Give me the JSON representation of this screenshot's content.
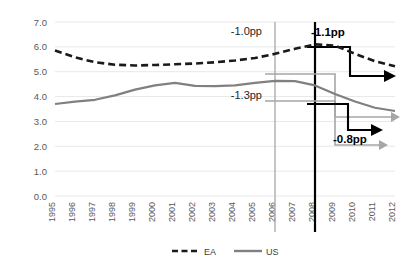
{
  "chart_data": {
    "type": "line",
    "title": "",
    "xlabel": "",
    "ylabel": "",
    "ylim": [
      0.0,
      7.0
    ],
    "ytick_labels": [
      "0.0",
      "1.0",
      "2.0",
      "3.0",
      "4.0",
      "5.0",
      "6.0",
      "7.0"
    ],
    "ytick_values": [
      0.0,
      1.0,
      2.0,
      3.0,
      4.0,
      5.0,
      6.0,
      7.0
    ],
    "grid": true,
    "legend_position": "bottom",
    "categories": [
      "1995",
      "1996",
      "1997",
      "1998",
      "1999",
      "2000",
      "2001",
      "2002",
      "2003",
      "2004",
      "2005",
      "2006",
      "2007",
      "2008",
      "2009",
      "2010",
      "2011",
      "2012"
    ],
    "series": [
      {
        "name": "EA",
        "style": "dashed",
        "color": "#1a1a1a",
        "values": [
          5.85,
          5.58,
          5.38,
          5.28,
          5.25,
          5.27,
          5.3,
          5.33,
          5.38,
          5.45,
          5.55,
          5.72,
          5.92,
          6.1,
          6.05,
          5.72,
          5.42,
          5.22
        ]
      },
      {
        "name": "US",
        "style": "solid",
        "color": "#808080",
        "values": [
          3.7,
          3.8,
          3.87,
          4.05,
          4.28,
          4.45,
          4.55,
          4.43,
          4.42,
          4.45,
          4.55,
          4.63,
          4.62,
          4.45,
          4.1,
          3.8,
          3.55,
          3.42
        ]
      }
    ],
    "legend": [
      {
        "label": "EA",
        "style": "dashed",
        "color": "#1a1a1a"
      },
      {
        "label": "US",
        "style": "solid",
        "color": "#808080"
      }
    ],
    "vertical_markers": [
      {
        "at": "2006",
        "color": "#a6a6a6"
      },
      {
        "at": "2008",
        "color": "#000000"
      }
    ],
    "annotations": [
      {
        "id": "ea-2006",
        "text": "-1.0pp",
        "bold": false,
        "x": 262,
        "y": 35,
        "anchor": "end"
      },
      {
        "id": "ea-2008",
        "text": "-1.1pp",
        "bold": true,
        "x": 311,
        "y": 36,
        "anchor": "start"
      },
      {
        "id": "us-2006",
        "text": "-1.3pp",
        "bold": false,
        "x": 262,
        "y": 99,
        "anchor": "end"
      },
      {
        "id": "us-2008",
        "text": "-0.8pp",
        "bold": true,
        "x": 333,
        "y": 143,
        "anchor": "start"
      }
    ]
  }
}
